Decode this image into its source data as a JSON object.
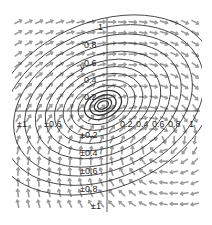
{
  "chart_data": {
    "type": "phase_portrait",
    "title": "",
    "xlabel": "x",
    "ylabel": "y",
    "xlim": [
      -1,
      1
    ],
    "ylim": [
      -1,
      1
    ],
    "grid": false,
    "legend": null,
    "x_ticks": [
      "±1",
      "±0.6",
      "0.2",
      "0.4",
      "0.6",
      "0.8",
      "1"
    ],
    "y_ticks": [
      "1",
      "0.8",
      "0.6",
      "0.4",
      "0.2",
      "±0.2",
      "±0.4",
      "±0.6",
      "±0.8",
      "±1"
    ],
    "vector_field": {
      "color": "#9a9a9a",
      "grid_cols": 18,
      "grid_rows": 18,
      "description": "rotational spiral flow around origin"
    },
    "trajectories": {
      "color": "#333333",
      "count": 14,
      "center": [
        0,
        0
      ],
      "shape": "tilted ellipses spiraling inward",
      "tilt_deg": -25
    },
    "colors": {
      "arrows": "#9a9a9a",
      "curves": "#333333",
      "axes": "#333333"
    }
  },
  "axis": {
    "y_label": "y",
    "x_label": "x"
  }
}
